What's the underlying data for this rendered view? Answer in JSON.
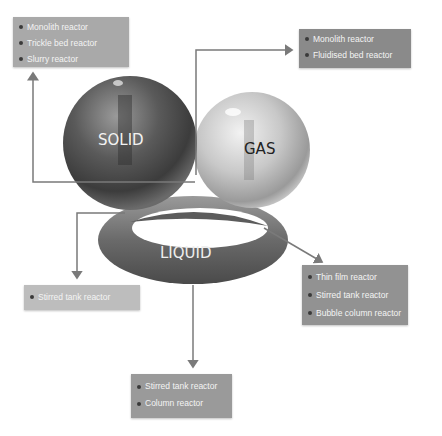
{
  "phases": {
    "solid": {
      "label": "SOLID",
      "reactors": [
        "Monolith reactor",
        "Trickle bed reactor",
        "Slurry reactor"
      ]
    },
    "gas": {
      "label": "GAS",
      "reactors": [
        "Monolith reactor",
        "Fluidised bed reactor"
      ]
    },
    "liquid": {
      "label": "LIQUID",
      "reactors_right": [
        "Thin film reactor",
        "Stirred tank reactor",
        "Bubble column reactor"
      ],
      "reactors_left": [
        "Stirred tank reactor"
      ],
      "reactors_bottom": [
        "Stirred tank reactor",
        "Column reactor"
      ]
    }
  },
  "colors": {
    "arrow": "#7a7a7a",
    "box_solid": "#a9a9a9",
    "box_gas": "#8a8a8a",
    "box_liquid_right": "#929292",
    "box_liquid_left": "#bdbdbd",
    "box_liquid_bottom": "#9a9a9a"
  }
}
